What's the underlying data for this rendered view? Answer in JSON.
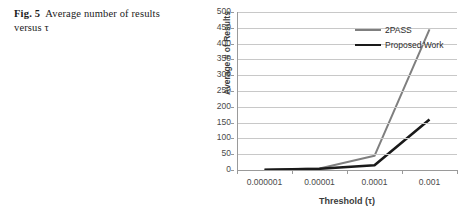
{
  "caption": {
    "fig_label": "Fig. 5",
    "text": "Average number of results versus τ"
  },
  "chart_data": {
    "type": "line",
    "title": "",
    "xlabel": "Threshold (τ)",
    "ylabel": "Average # of Results",
    "categories": [
      "0.000001",
      "0.00001",
      "0.0001",
      "0.001"
    ],
    "yticks": [
      0,
      50,
      100,
      150,
      200,
      250,
      300,
      350,
      400,
      450,
      500
    ],
    "ylim": [
      0,
      500
    ],
    "grid": true,
    "legend_position": "top-center-inside",
    "series": [
      {
        "name": "2PASS",
        "color": "#7f7f7f",
        "width": 2,
        "values": [
          1,
          5,
          45,
          445
        ]
      },
      {
        "name": "Proposed Work",
        "color": "#1a1a1a",
        "width": 2.6,
        "values": [
          1,
          4,
          15,
          160
        ]
      }
    ]
  }
}
